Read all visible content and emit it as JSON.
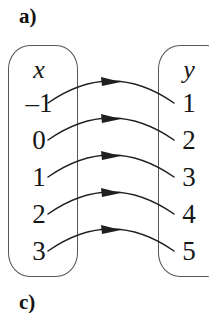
{
  "figure": {
    "part_label": "a)",
    "next_part_label": "c)",
    "type": "mapping-diagram"
  },
  "left_set": {
    "header": "x",
    "values": [
      "–1",
      "0",
      "1",
      "2",
      "3"
    ]
  },
  "right_set": {
    "header": "y",
    "values": [
      "1",
      "2",
      "3",
      "4",
      "5"
    ]
  },
  "mapping": [
    {
      "from": "–1",
      "to": "1"
    },
    {
      "from": "0",
      "to": "2"
    },
    {
      "from": "1",
      "to": "3"
    },
    {
      "from": "2",
      "to": "4"
    },
    {
      "from": "3",
      "to": "5"
    }
  ],
  "style": {
    "stroke_color": "#1f1f1f",
    "box_border_color": "#55555a",
    "text_color": "#161616",
    "background": "#ffffff"
  }
}
